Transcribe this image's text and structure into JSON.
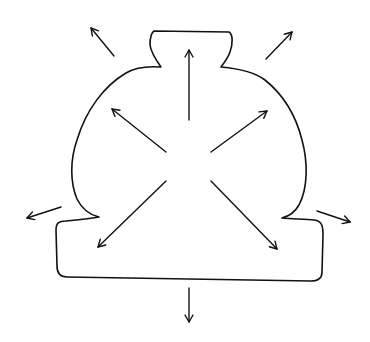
{
  "diagram": {
    "stroke_color": "#111111",
    "background": "#ffffff",
    "inner_arrows": [
      {
        "name": "up",
        "x1": 189,
        "y1": 120,
        "x2": 189,
        "y2": 50
      },
      {
        "name": "up-left",
        "x1": 166,
        "y1": 152,
        "x2": 112,
        "y2": 109
      },
      {
        "name": "up-right",
        "x1": 211,
        "y1": 152,
        "x2": 267,
        "y2": 111
      },
      {
        "name": "down-left",
        "x1": 166,
        "y1": 181,
        "x2": 98,
        "y2": 247
      },
      {
        "name": "down-right",
        "x1": 211,
        "y1": 181,
        "x2": 277,
        "y2": 249
      }
    ],
    "outer_arrows": [
      {
        "name": "outer-up-left",
        "x1": 114,
        "y1": 56,
        "x2": 91,
        "y2": 28
      },
      {
        "name": "outer-up-right",
        "x1": 266,
        "y1": 59,
        "x2": 292,
        "y2": 32
      },
      {
        "name": "outer-left",
        "x1": 61,
        "y1": 207,
        "x2": 27,
        "y2": 218
      },
      {
        "name": "outer-right",
        "x1": 317,
        "y1": 211,
        "x2": 350,
        "y2": 222
      },
      {
        "name": "outer-down",
        "x1": 189,
        "y1": 288,
        "x2": 189,
        "y2": 322
      }
    ]
  }
}
